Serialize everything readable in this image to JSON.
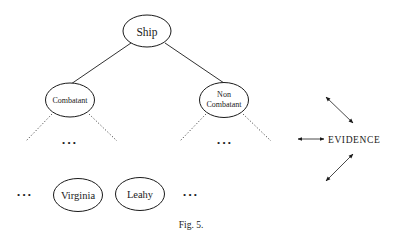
{
  "diagram": {
    "nodes": {
      "ship": {
        "label": "Ship"
      },
      "combatant": {
        "label": "Combatant"
      },
      "noncombatant": {
        "line1": "Non",
        "line2": "Combatant"
      },
      "virginia": {
        "label": "Virginia"
      },
      "leahy": {
        "label": "Leahy"
      }
    },
    "ellipsis": "• • •",
    "evidence": {
      "label": "EVIDENCE"
    },
    "caption": "Fig. 5."
  },
  "colors": {
    "ink": "#1a1a1a",
    "background": "#ffffff"
  }
}
